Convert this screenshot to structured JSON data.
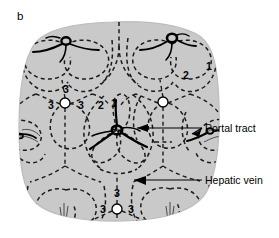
{
  "figure": {
    "panel_label": "b",
    "background_color": "#ffffff",
    "tissue_fill": "#c9c9c9",
    "tissue_stroke": "#b0b0b0",
    "dashed_line_color": "#1a1a1a",
    "portal_tract_color": "#000000",
    "hepatic_vein_fill": "#ffffff",
    "hepatic_vein_stroke": "#000000",
    "label_color": "#000000"
  },
  "annotations": [
    {
      "id": "portal-tract",
      "label": "Portal tract",
      "x": 205,
      "y": 128
    },
    {
      "id": "hepatic-vein",
      "label": "Hepatic vein",
      "x": 205,
      "y": 182
    }
  ],
  "zone_labels": [
    {
      "text": "1",
      "x": 209,
      "y": 66,
      "group": "top-right-portal"
    },
    {
      "text": "2",
      "x": 186,
      "y": 75,
      "group": "top-right-portal"
    },
    {
      "text": "3",
      "x": 66,
      "y": 89,
      "group": "left-central-vein"
    },
    {
      "text": "3",
      "x": 51,
      "y": 105,
      "group": "left-central-vein"
    },
    {
      "text": "3",
      "x": 81,
      "y": 105,
      "group": "left-central-vein"
    },
    {
      "text": "2",
      "x": 101,
      "y": 105,
      "group": "middle-portal"
    },
    {
      "text": "1",
      "x": 114,
      "y": 103,
      "group": "middle-portal"
    },
    {
      "text": "3",
      "x": 117,
      "y": 193,
      "group": "bottom-central-vein"
    },
    {
      "text": "3",
      "x": 103,
      "y": 209,
      "group": "bottom-central-vein"
    },
    {
      "text": "3",
      "x": 131,
      "y": 209,
      "group": "bottom-central-vein"
    }
  ],
  "portal_tracts": [
    {
      "id": "portal-tract-top-left",
      "x": 66,
      "y": 44
    },
    {
      "id": "portal-tract-top-right",
      "x": 172,
      "y": 41
    },
    {
      "id": "portal-tract-center",
      "x": 117,
      "y": 130
    },
    {
      "id": "portal-tract-left-edge",
      "x": 31,
      "y": 135
    },
    {
      "id": "portal-tract-right-edge",
      "x": 200,
      "y": 133
    }
  ],
  "hepatic_veins": [
    {
      "id": "hepatic-vein-left",
      "x": 65,
      "y": 103,
      "r": 5
    },
    {
      "id": "hepatic-vein-right",
      "x": 163,
      "y": 102,
      "r": 5
    },
    {
      "id": "hepatic-vein-bottom",
      "x": 117,
      "y": 209,
      "r": 5
    }
  ]
}
